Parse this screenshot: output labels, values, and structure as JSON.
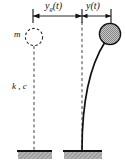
{
  "figure": {
    "type": "engineering-diagram",
    "width": 125,
    "height": 166,
    "background_color": "#ffffff",
    "line_color": "#111111",
    "mass_fill_color": "#a8a8a8",
    "hatch_color": "#8f8f8f"
  },
  "labels": {
    "ground_displacement": {
      "base": "y",
      "subscript": "g",
      "argument": "(t)",
      "full": "yg(t)"
    },
    "structure_displacement": {
      "base": "y",
      "subscript": "",
      "argument": "(t)",
      "full": "y(t)"
    },
    "mass": "m",
    "stiffness_damping": "k , c"
  },
  "dimension_line": {
    "y": 16,
    "ticks_x": [
      33,
      82,
      111
    ],
    "segments": [
      {
        "name": "ground-displacement-segment",
        "from_x": 33,
        "to_x": 82,
        "label": "yg(t)"
      },
      {
        "name": "structure-displacement-segment",
        "from_x": 82,
        "to_x": 111,
        "label": "y(t)"
      }
    ]
  },
  "elements": {
    "undeformed_mass": {
      "name": "dashed-mass-circle",
      "cx": 34,
      "cy": 37,
      "r": 9,
      "style": "dashed-outline"
    },
    "deformed_mass": {
      "name": "filled-mass-circle",
      "cx": 110,
      "cy": 34,
      "r": 11,
      "style": "stippled-fill"
    },
    "reference_line_left": {
      "name": "left-dashed-axis",
      "x": 34,
      "from_y": 47,
      "to_y": 150
    },
    "reference_line_right": {
      "name": "right-dashed-axis",
      "x": 82,
      "from_y": 22,
      "to_y": 150
    },
    "flexible_column": {
      "name": "curved-column",
      "base_x": 82,
      "base_y": 150,
      "top_x": 105,
      "top_y": 42
    },
    "base_left": {
      "name": "left-ground-support",
      "x": 18,
      "y": 150,
      "width": 34,
      "height": 9
    },
    "base_right": {
      "name": "right-ground-support",
      "x": 64,
      "y": 150,
      "width": 38,
      "height": 9
    }
  }
}
